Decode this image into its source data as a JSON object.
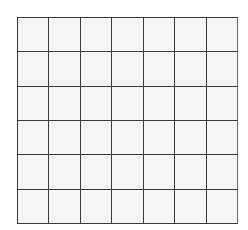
{
  "grid": {
    "columns": 7,
    "rows": 6,
    "line_color": "#3a3a3a",
    "cell_fill": "#f5f5f5",
    "background": "#ffffff",
    "cells": [
      [
        "",
        "",
        "",
        "",
        "",
        "",
        ""
      ],
      [
        "",
        "",
        "",
        "",
        "",
        "",
        ""
      ],
      [
        "",
        "",
        "",
        "",
        "",
        "",
        ""
      ],
      [
        "",
        "",
        "",
        "",
        "",
        "",
        ""
      ],
      [
        "",
        "",
        "",
        "",
        "",
        "",
        ""
      ],
      [
        "",
        "",
        "",
        "",
        "",
        "",
        ""
      ]
    ]
  }
}
